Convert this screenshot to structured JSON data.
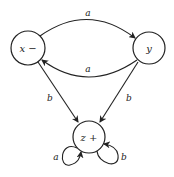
{
  "diagram": {
    "type": "state-transition-graph",
    "colors": {
      "stroke": "#222222",
      "background": "#ffffff"
    },
    "nodes": [
      {
        "id": "x",
        "label": "x −",
        "cx": 28,
        "cy": 48,
        "r": 17
      },
      {
        "id": "y",
        "label": "y",
        "cx": 149,
        "cy": 48,
        "r": 16
      },
      {
        "id": "z",
        "label": "z +",
        "cx": 89,
        "cy": 137,
        "r": 16
      }
    ],
    "edges": [
      {
        "from": "x",
        "to": "y",
        "label": "a"
      },
      {
        "from": "y",
        "to": "x",
        "label": "a"
      },
      {
        "from": "x",
        "to": "z",
        "label": "b"
      },
      {
        "from": "y",
        "to": "z",
        "label": "b"
      },
      {
        "from": "z",
        "to": "z",
        "label": "a"
      },
      {
        "from": "z",
        "to": "z",
        "label": "b"
      }
    ]
  },
  "labels": {
    "node_x": "x −",
    "node_y": "y",
    "node_z": "z +",
    "edge_x_y": "a",
    "edge_y_x": "a",
    "edge_x_z": "b",
    "edge_y_z": "b",
    "loop_z_a": "a",
    "loop_z_b": "b"
  }
}
